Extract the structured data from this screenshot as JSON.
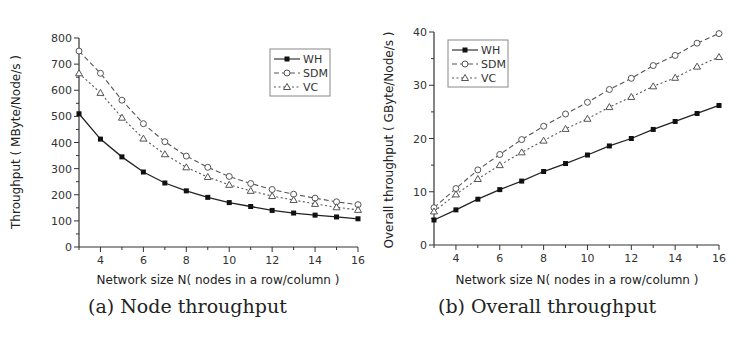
{
  "chart_data": [
    {
      "type": "line",
      "title": "",
      "caption": "(a) Node throughput",
      "xlabel": "Network size N(  nodes in a row/column )",
      "ylabel": "Throughput (  MByte/Node/s )",
      "xlim": [
        3,
        16
      ],
      "ylim": [
        0,
        800
      ],
      "xticks": [
        4,
        6,
        8,
        10,
        12,
        14,
        16
      ],
      "yticks": [
        0,
        100,
        200,
        300,
        400,
        500,
        600,
        700,
        800
      ],
      "grid": false,
      "legend_position": "upper right",
      "x": [
        3,
        4,
        5,
        6,
        7,
        8,
        9,
        10,
        11,
        12,
        13,
        14,
        15,
        16
      ],
      "series": [
        {
          "name": "WH",
          "style": "solid",
          "marker": "filled-square",
          "values": [
            510,
            413,
            345,
            287,
            245,
            215,
            190,
            170,
            155,
            140,
            130,
            122,
            115,
            108
          ]
        },
        {
          "name": "SDM",
          "style": "dashed",
          "marker": "open-circle",
          "values": [
            750,
            665,
            562,
            472,
            403,
            348,
            305,
            270,
            243,
            220,
            202,
            187,
            173,
            162
          ]
        },
        {
          "name": "VC",
          "style": "dotted",
          "marker": "open-triangle",
          "values": [
            665,
            590,
            495,
            415,
            355,
            305,
            268,
            238,
            215,
            195,
            180,
            165,
            152,
            142
          ]
        }
      ]
    },
    {
      "type": "line",
      "title": "",
      "caption": "(b) Overall throughput",
      "xlabel": "Network size N(  nodes in a row/column )",
      "ylabel": "Overall throughput (  GByte/Node/s )",
      "xlim": [
        3,
        16
      ],
      "ylim": [
        0,
        40
      ],
      "xticks": [
        4,
        6,
        8,
        10,
        12,
        14,
        16
      ],
      "yticks": [
        0,
        10,
        20,
        30,
        40
      ],
      "grid": false,
      "legend_position": "upper left",
      "x": [
        3,
        4,
        5,
        6,
        7,
        8,
        9,
        10,
        11,
        12,
        13,
        14,
        15,
        16
      ],
      "series": [
        {
          "name": "WH",
          "style": "solid",
          "marker": "filled-square",
          "values": [
            4.7,
            6.6,
            8.6,
            10.4,
            12.0,
            13.8,
            15.3,
            16.9,
            18.6,
            20.0,
            21.7,
            23.2,
            24.7,
            26.2
          ]
        },
        {
          "name": "SDM",
          "style": "dashed",
          "marker": "open-circle",
          "values": [
            7.0,
            10.6,
            14.1,
            17.0,
            19.8,
            22.3,
            24.6,
            26.8,
            29.2,
            31.3,
            33.7,
            35.6,
            37.9,
            39.7
          ]
        },
        {
          "name": "VC",
          "style": "dotted",
          "marker": "open-triangle",
          "values": [
            6.3,
            9.5,
            12.4,
            15.0,
            17.4,
            19.6,
            21.8,
            23.7,
            25.9,
            27.8,
            29.8,
            31.4,
            33.5,
            35.3
          ]
        }
      ]
    }
  ],
  "colors": {
    "axis": "#333333",
    "line": "#222222",
    "open_marker": "#555555"
  }
}
